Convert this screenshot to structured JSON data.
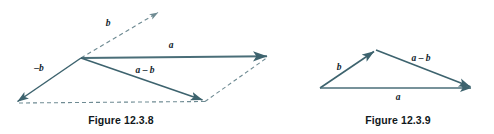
{
  "page": {
    "background_color": "#ffffff",
    "width": 494,
    "height": 134
  },
  "style": {
    "vector_stroke_color": "#4a6e78",
    "dashed_stroke_color": "#6f8b93",
    "label_color": "#10222b",
    "caption_color": "#111820"
  },
  "figures": [
    {
      "id": "figure-12-3-8",
      "caption": "Figure 12.3.8",
      "description": "parallelogram-vector-subtraction",
      "labels": {
        "b": "b",
        "minus_b": "–b",
        "a": "a",
        "a_minus_b": "a – b"
      },
      "vectors": [
        {
          "name": "b",
          "style": "dashed",
          "from": [
            81,
            58
          ],
          "to": [
            160,
            11
          ],
          "arrow": true
        },
        {
          "name": "minus-b",
          "style": "solid",
          "from": [
            81,
            58
          ],
          "to": [
            15,
            103
          ],
          "arrow": true
        },
        {
          "name": "a",
          "style": "solid",
          "from": [
            81,
            58
          ],
          "to": [
            270,
            56
          ],
          "arrow": true
        },
        {
          "name": "a-minus-b",
          "style": "solid",
          "from": [
            81,
            58
          ],
          "to": [
            205,
            101
          ],
          "arrow": true
        },
        {
          "name": "baseline",
          "style": "dashed",
          "from": [
            15,
            103
          ],
          "to": [
            205,
            101
          ],
          "arrow": false
        },
        {
          "name": "closing-side",
          "style": "dashed",
          "from": [
            205,
            101
          ],
          "to": [
            270,
            56
          ],
          "arrow": false
        }
      ]
    },
    {
      "id": "figure-12-3-9",
      "caption": "Figure 12.3.9",
      "description": "triangle-vector-subtraction",
      "labels": {
        "b": "b",
        "a_minus_b": "a – b",
        "a": "a"
      },
      "vectors": [
        {
          "name": "b",
          "style": "solid",
          "from": [
            320,
            88
          ],
          "to": [
            376,
            50
          ],
          "arrow": true
        },
        {
          "name": "a-minus-b",
          "style": "solid",
          "from": [
            376,
            50
          ],
          "to": [
            473,
            88
          ],
          "arrow": true
        },
        {
          "name": "a",
          "style": "solid",
          "from": [
            320,
            88
          ],
          "to": [
            473,
            88
          ],
          "arrow": true
        }
      ]
    }
  ]
}
